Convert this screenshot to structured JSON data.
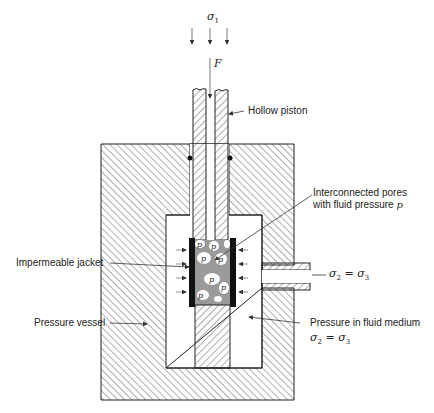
{
  "diagram": {
    "type": "triaxial-test-apparatus-cross-section",
    "top_stress": {
      "symbol": "σ",
      "subscript": "1"
    },
    "force": {
      "symbol": "F"
    },
    "pore_symbol": "p",
    "labels": {
      "hollow_piston": "Hollow piston",
      "interconnected_pores_line1": "Interconnected pores",
      "interconnected_pores_line2": "with fluid pressure",
      "interconnected_pores_symbol": "p",
      "impermeable_jacket": "Impermeable jacket",
      "pressure_vessel": "Pressure vessel",
      "pressure_in_fluid_medium": "Pressure in fluid medium"
    },
    "port_stress": {
      "s2": "σ",
      "s2_sub": "2",
      "eq": "=",
      "s3": "σ",
      "s3_sub": "3"
    },
    "fluid_stress": {
      "s2": "σ",
      "s2_sub": "2",
      "eq": "=",
      "s3": "σ",
      "s3_sub": "3"
    },
    "colors": {
      "line": "#222222",
      "hatch": "#333333",
      "pore_fill": "#9a9a9a",
      "jacket": "#111111",
      "background": "#ffffff"
    }
  }
}
